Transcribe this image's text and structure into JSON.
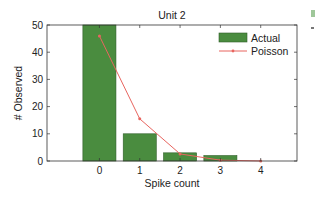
{
  "chart_data": {
    "type": "bar",
    "title": "Unit 2",
    "xlabel": "Spike count",
    "ylabel": "# Observed",
    "categories": [
      "0",
      "1",
      "2",
      "3",
      "4"
    ],
    "x": [
      0,
      1,
      2,
      3,
      4
    ],
    "series": [
      {
        "name": "Actual",
        "type": "bar",
        "color": "#4a8c3f",
        "values": [
          50,
          10,
          3,
          2,
          0
        ]
      },
      {
        "name": "Poisson",
        "type": "line",
        "color": "#e8655f",
        "marker": "dot",
        "values": [
          46,
          15.5,
          2.6,
          0.3,
          0.02
        ]
      }
    ],
    "xlim": [
      -1.3,
      4.9
    ],
    "ylim": [
      0,
      50
    ],
    "yticks": [
      0,
      10,
      20,
      30,
      40,
      50
    ],
    "xticks": [
      0,
      1,
      2,
      3,
      4
    ],
    "grid": false,
    "legend_position": "upper right"
  },
  "legend": {
    "actual": "Actual",
    "poisson": "Poisson"
  }
}
